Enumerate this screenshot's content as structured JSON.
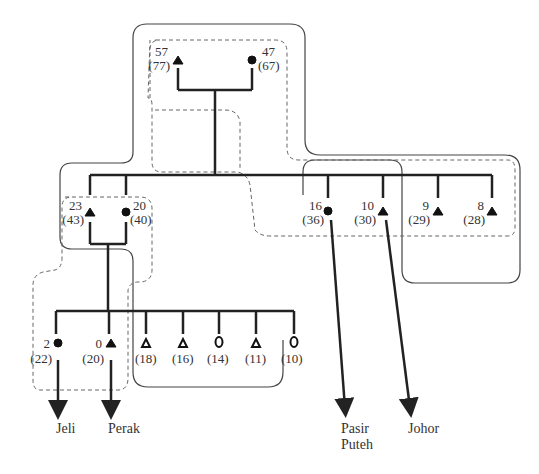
{
  "diagram": {
    "type": "genealogy-migration-diagram",
    "colors": {
      "line": "#222222",
      "outline": "#444444",
      "dashed": "#555555",
      "text": "#333333"
    },
    "generation1": {
      "male": {
        "age": "57",
        "paren": "(77)",
        "symbol": "filled-triangle"
      },
      "female": {
        "age": "47",
        "paren": "(67)",
        "symbol": "filled-circle"
      }
    },
    "generation2": [
      {
        "id": "g2-1",
        "age": "23",
        "paren": "(43)",
        "symbol": "filled-triangle"
      },
      {
        "id": "g2-2",
        "age": "20",
        "paren": "(40)",
        "symbol": "filled-circle"
      },
      {
        "id": "g2-3",
        "age": "16",
        "paren": "(36)",
        "symbol": "filled-circle",
        "migrates_to": "Pasir Puteh"
      },
      {
        "id": "g2-4",
        "age": "10",
        "paren": "(30)",
        "symbol": "filled-triangle",
        "migrates_to": "Johor"
      },
      {
        "id": "g2-5",
        "age": "9",
        "paren": "(29)",
        "symbol": "filled-triangle"
      },
      {
        "id": "g2-6",
        "age": "8",
        "paren": "(28)",
        "symbol": "filled-triangle"
      }
    ],
    "generation3": [
      {
        "id": "g3-1",
        "age": "2",
        "paren": "(22)",
        "symbol": "filled-circle",
        "migrates_to": "Jeli"
      },
      {
        "id": "g3-2",
        "age": "0",
        "paren": "(20)",
        "symbol": "filled-triangle",
        "migrates_to": "Perak"
      },
      {
        "id": "g3-3",
        "age": "",
        "paren": "(18)",
        "symbol": "open-triangle"
      },
      {
        "id": "g3-4",
        "age": "",
        "paren": "(16)",
        "symbol": "open-triangle"
      },
      {
        "id": "g3-5",
        "age": "",
        "paren": "(14)",
        "symbol": "open-circle"
      },
      {
        "id": "g3-6",
        "age": "",
        "paren": "(11)",
        "symbol": "open-triangle"
      },
      {
        "id": "g3-7",
        "age": "",
        "paren": "(10)",
        "symbol": "open-circle"
      }
    ],
    "destinations": {
      "jeli": "Jeli",
      "perak": "Perak",
      "pasir_puteh_1": "Pasir",
      "pasir_puteh_2": "Puteh",
      "johor": "Johor"
    }
  }
}
